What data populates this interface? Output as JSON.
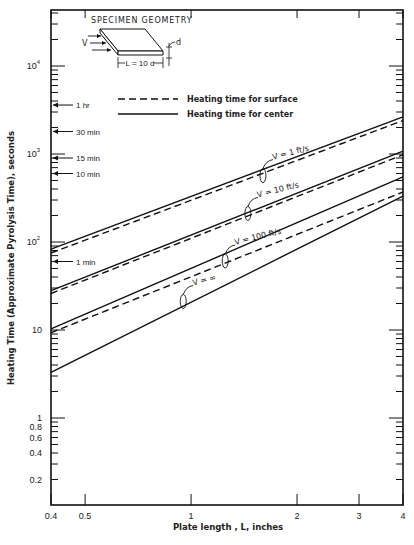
{
  "chart_data": {
    "type": "line",
    "title": "",
    "xlabel": "Plate length , L, inches",
    "ylabel": "Heating Time (Approximate Pyrolysis Time), seconds",
    "xscale": "log",
    "yscale": "log",
    "xlim": [
      0.4,
      4
    ],
    "ylim": [
      0.1,
      30000
    ],
    "grid": false,
    "x_ticks": [
      {
        "value": 0.4,
        "label": "0.4"
      },
      {
        "value": 0.5,
        "label": "0.5"
      },
      {
        "value": 1,
        "label": "1"
      },
      {
        "value": 2,
        "label": "2"
      },
      {
        "value": 3,
        "label": "3"
      },
      {
        "value": 4,
        "label": "4"
      }
    ],
    "y_ticks": [
      {
        "value": 10000,
        "label": "10^4",
        "base": "10",
        "exp": "4"
      },
      {
        "value": 1000,
        "label": "10^3",
        "base": "10",
        "exp": "3"
      },
      {
        "value": 100,
        "label": "10^2",
        "base": "10",
        "exp": "2"
      },
      {
        "value": 10,
        "label": "10"
      },
      {
        "value": 1,
        "label": "1"
      },
      {
        "value": 0.8,
        "label": "0.8"
      },
      {
        "value": 0.6,
        "label": "0.6"
      },
      {
        "value": 0.4,
        "label": "0.4"
      },
      {
        "value": 0.2,
        "label": "0.2"
      }
    ],
    "time_markers": [
      {
        "value": 3600,
        "label": "1 hr"
      },
      {
        "value": 1800,
        "label": "30 min"
      },
      {
        "value": 900,
        "label": "15 min"
      },
      {
        "value": 600,
        "label": "10 min"
      },
      {
        "value": 60,
        "label": "1 min"
      }
    ],
    "legend": [
      {
        "label": "Heating time for surface",
        "style": "dashed"
      },
      {
        "label": "Heating time for center",
        "style": "solid"
      }
    ],
    "inset": {
      "title": "SPECIMEN GEOMETRY",
      "velocity_label": "V",
      "thickness_label": "d",
      "length_label": "L = 10 d"
    },
    "x": [
      0.4,
      4
    ],
    "series": [
      {
        "name": "V = 1 ft/s, center",
        "style": "solid",
        "values": [
          83,
          2640
        ]
      },
      {
        "name": "V = 1 ft/s, surface",
        "style": "dashed",
        "values": [
          75,
          2400
        ]
      },
      {
        "name": "V = 10 ft/s, center",
        "style": "solid",
        "values": [
          28,
          1080
        ]
      },
      {
        "name": "V = 10 ft/s, surface",
        "style": "dashed",
        "values": [
          26,
          980
        ]
      },
      {
        "name": "V = 100 ft/s, center",
        "style": "solid",
        "values": [
          10.3,
          550
        ]
      },
      {
        "name": "V = 100 ft/s, surface",
        "style": "dashed",
        "values": [
          9.3,
          370
        ]
      },
      {
        "name": "V = ∞",
        "style": "solid",
        "values": [
          3.3,
          333
        ]
      }
    ],
    "annotations": [
      {
        "text": "V = 1 ft/s",
        "x": 1.6,
        "y": 700
      },
      {
        "text": "V = 10 ft/s",
        "x": 1.45,
        "y": 260
      },
      {
        "text": "V = 100 ft/s",
        "x": 1.25,
        "y": 75
      },
      {
        "text": "V = ∞",
        "x": 0.95,
        "y": 26
      }
    ]
  }
}
